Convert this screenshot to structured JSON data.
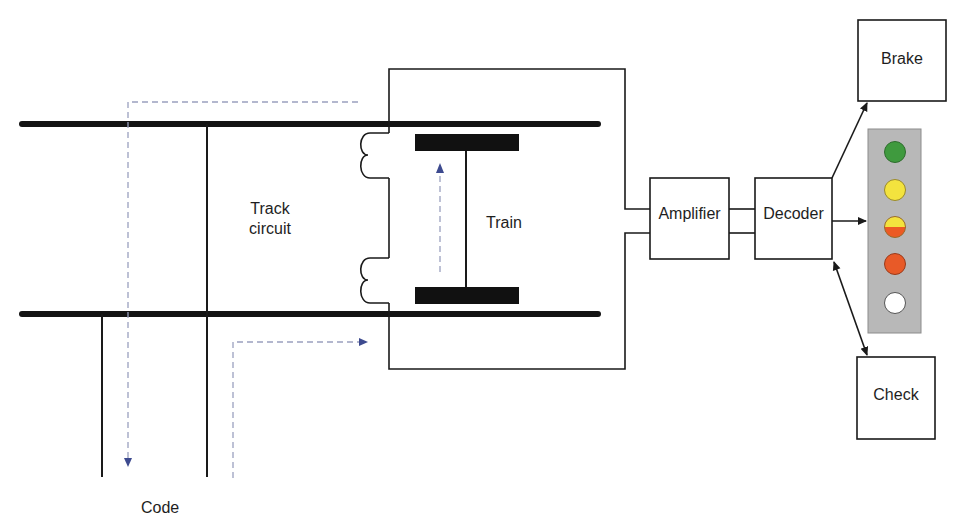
{
  "labels": {
    "track_circuit_line1": "Track",
    "track_circuit_line2": "circuit",
    "train": "Train",
    "code": "Code",
    "amplifier": "Amplifier",
    "decoder": "Decoder",
    "brake": "Brake",
    "check": "Check"
  },
  "signal_panel": {
    "background": "#b7b7b7",
    "lamps": [
      {
        "name": "green",
        "color": "#3f9a3e"
      },
      {
        "name": "yellow",
        "color": "#f3e33e"
      },
      {
        "name": "yellow-red",
        "color_top": "#f3e33e",
        "color_bottom": "#ec5a24"
      },
      {
        "name": "red",
        "color": "#e85a28"
      },
      {
        "name": "white",
        "color": "#ffffff"
      }
    ]
  },
  "colors": {
    "line": "#1a1a1a",
    "dashed_flow": "#8d95bd",
    "flow_arrow": "#3d4a8f"
  }
}
